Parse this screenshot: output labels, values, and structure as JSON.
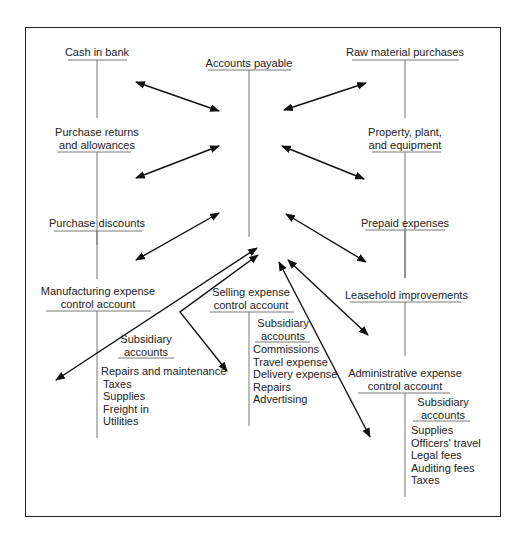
{
  "diagram": {
    "center_account": {
      "title": "Accounts payable"
    },
    "left_accounts": [
      {
        "title_lines": [
          "Cash in bank"
        ]
      },
      {
        "title_lines": [
          "Purchase returns",
          "and allowances"
        ]
      },
      {
        "title_lines": [
          "Purchase discounts"
        ]
      },
      {
        "title_lines": [
          "Manufacturing expense",
          "control account"
        ],
        "subsidiary": {
          "heading_lines": [
            "Subsidiary",
            "accounts"
          ],
          "items": [
            "Repairs and maintenance",
            "Taxes",
            "Supplies",
            "Freight in",
            "Utilities"
          ]
        }
      }
    ],
    "middle_account": {
      "title_lines": [
        "Selling expense",
        "control account"
      ],
      "subsidiary": {
        "heading_lines": [
          "Subsidiary",
          "accounts"
        ],
        "items": [
          "Commissions",
          "Travel expense",
          "Delivery expense",
          "Repairs",
          "Advertising"
        ]
      }
    },
    "right_accounts": [
      {
        "title_lines": [
          "Raw material purchases"
        ]
      },
      {
        "title_lines": [
          "Property, plant,",
          "and equipment"
        ]
      },
      {
        "title_lines": [
          "Prepaid expenses"
        ]
      },
      {
        "title_lines": [
          "Leasehold improvements"
        ]
      },
      {
        "title_lines": [
          "Administrative expense",
          "control account"
        ],
        "subsidiary": {
          "heading_lines": [
            "Subsidiary",
            "accounts"
          ],
          "items": [
            "Supplies",
            "Officers' travel",
            "Legal fees",
            "Auditing fees",
            "Taxes"
          ]
        }
      }
    ]
  }
}
